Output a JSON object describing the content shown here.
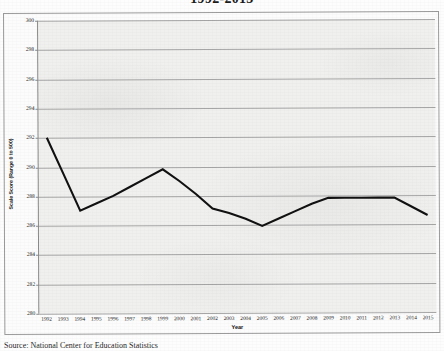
{
  "document": {
    "title_visible": "1992-2015",
    "source_note": "Source: National Center for Education Statistics"
  },
  "chart_data": {
    "type": "line",
    "title": "1992-2015",
    "xlabel": "Year",
    "ylabel": "Scale Score (Range 0 to 500)",
    "ylim": [
      280,
      300
    ],
    "ytick_step": 2,
    "yticks": [
      "300",
      "298",
      "296",
      "294",
      "292",
      "290",
      "288",
      "286",
      "284",
      "282",
      "280"
    ],
    "grid": "horizontal",
    "legend": "none",
    "line_color": "#111111",
    "categories": [
      "1992",
      "1993",
      "1994",
      "1995",
      "1996",
      "1997",
      "1998",
      "1999",
      "2000",
      "2001",
      "2002",
      "2003",
      "2004",
      "2005",
      "2006",
      "2007",
      "2008",
      "2009",
      "2010",
      "2011",
      "2012",
      "2013",
      "2014",
      "2015"
    ],
    "values": [
      292.0,
      289.5,
      287.0,
      287.5,
      288.0,
      288.6,
      289.2,
      289.8,
      289.0,
      288.1,
      287.1,
      286.8,
      286.4,
      285.9,
      286.4,
      286.9,
      287.4,
      287.8,
      287.8,
      287.8,
      287.8,
      287.8,
      287.2,
      286.6
    ],
    "series_name": "Scale Score"
  }
}
